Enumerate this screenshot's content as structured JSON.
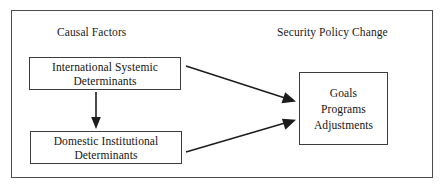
{
  "figure": {
    "type": "causal-flow-diagram",
    "border_color": "#4a4a4a",
    "background": "#ffffff",
    "text_color": "#141414"
  },
  "headings": {
    "left": "Causal Factors",
    "right": "Security Policy Change"
  },
  "nodes": {
    "international": {
      "line1": "International Systemic",
      "line2": "Determinants"
    },
    "domestic": {
      "line1": "Domestic Institutional",
      "line2": "Determinants"
    },
    "outcome": {
      "line1": "Goals",
      "line2": "Programs",
      "line3": "Adjustments"
    }
  },
  "arrows": [
    {
      "name": "international-to-domestic",
      "from": "International Systemic Determinants",
      "to": "Domestic Institutional Determinants",
      "direction": "down"
    },
    {
      "name": "international-to-outcome",
      "from": "International Systemic Determinants",
      "to": "Goals Programs Adjustments",
      "direction": "down-right"
    },
    {
      "name": "domestic-to-outcome",
      "from": "Domestic Institutional Determinants",
      "to": "Goals Programs Adjustments",
      "direction": "up-right"
    }
  ]
}
